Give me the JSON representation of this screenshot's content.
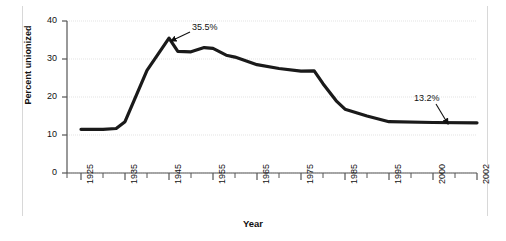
{
  "chart_data": {
    "type": "line",
    "title": "",
    "xlabel": "Year",
    "ylabel": "Percent unionized",
    "xlim": [
      1925,
      2002
    ],
    "ylim": [
      0,
      40
    ],
    "grid": true,
    "legend": "none",
    "line_color": "#1a1a1a",
    "grid_color": "#e3e3e3",
    "axis_color": "#555555",
    "x": [
      1925,
      1930,
      1933,
      1935,
      1940,
      1945,
      1947,
      1950,
      1953,
      1955,
      1958,
      1960,
      1965,
      1970,
      1975,
      1978,
      1980,
      1983,
      1985,
      1990,
      1995,
      2000,
      2002
    ],
    "y": [
      11.5,
      11.5,
      11.7,
      13.5,
      27.0,
      35.5,
      32.0,
      31.9,
      33.0,
      32.8,
      31.0,
      30.5,
      28.5,
      27.5,
      26.8,
      26.9,
      23.5,
      19.0,
      16.8,
      15.0,
      13.5,
      13.3,
      13.2
    ],
    "y_ticks": [
      0,
      10,
      20,
      30,
      40
    ],
    "y_tick_labels": [
      "0",
      "10",
      "20",
      "30",
      "40"
    ],
    "x_ticks": [
      1925,
      1935,
      1945,
      1955,
      1965,
      1975,
      1985,
      1995,
      2000,
      2002
    ],
    "x_tick_labels": [
      "1925",
      "1935",
      "1945",
      "1955",
      "1965",
      "1975",
      "1985",
      "1995",
      "2000",
      "2002"
    ],
    "annotations": [
      {
        "label": "35.5%",
        "x": 1945,
        "y": 35.5,
        "text_px": [
          192,
          22
        ],
        "arrow_from_px": [
          190,
          32
        ],
        "arrow_to_px": [
          171,
          41
        ]
      },
      {
        "label": "13.2%",
        "x": 2002,
        "y": 13.2,
        "text_px": [
          414,
          93
        ],
        "arrow_from_px": [
          436,
          104
        ],
        "arrow_to_px": [
          448,
          124
        ]
      }
    ]
  }
}
